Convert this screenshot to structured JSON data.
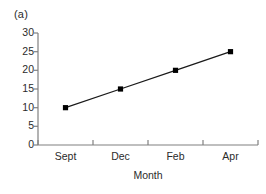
{
  "figure": {
    "panel_label": "(a)",
    "background_color": "#ffffff",
    "axis_color": "#808080",
    "series_color": "#1a1a1a",
    "marker_color": "#000000"
  },
  "chart_data": {
    "type": "line",
    "title": "",
    "subtitle": "",
    "panel_label": "(a)",
    "categories": [
      "Sept",
      "Dec",
      "Feb",
      "Apr"
    ],
    "values": [
      10,
      15,
      20,
      25
    ],
    "series": [
      {
        "name": "",
        "values": [
          10,
          15,
          20,
          25
        ]
      }
    ],
    "xlabel": "Month",
    "ylabel": "",
    "ylim": [
      0,
      30
    ],
    "yticks": [
      0,
      5,
      10,
      15,
      20,
      25,
      30
    ],
    "ytick_labels": [
      "0",
      "5",
      "10",
      "15",
      "20",
      "25",
      "30"
    ],
    "xtick_labels": [
      "Sept",
      "Dec",
      "Feb",
      "Apr"
    ],
    "grid": false,
    "legend": false,
    "legend_position": "none",
    "marker": "square",
    "line_style": "solid",
    "annotations": []
  }
}
